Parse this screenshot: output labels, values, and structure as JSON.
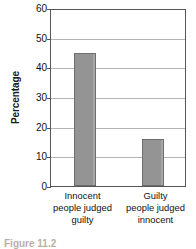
{
  "chart_data": {
    "type": "bar",
    "title": "",
    "subtitle": "",
    "xlabel": "",
    "ylabel": "Percentage",
    "ylim": [
      0,
      60
    ],
    "yticks": [
      0,
      10,
      20,
      30,
      40,
      50,
      60
    ],
    "ytick_labels": [
      "0",
      "10",
      "20",
      "30",
      "40",
      "50",
      "60"
    ],
    "grid": true,
    "legend": "none",
    "categories": [
      "Innocent people judged guilty",
      "Guilty people judged innocent"
    ],
    "category_lines": [
      [
        "Innocent",
        "people judged",
        "guilty"
      ],
      [
        "Guilty",
        "people judged",
        "innocent"
      ]
    ],
    "values": [
      45,
      16
    ],
    "bar_color": "#949494",
    "bar_edge_color": "#6e6e6e",
    "gridline_color": "#b4b4b4",
    "frame_color": "#555555"
  },
  "caption": {
    "text": "Figure 11.2"
  }
}
